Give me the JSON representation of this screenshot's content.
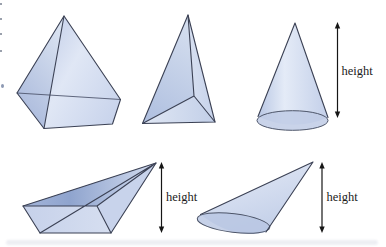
{
  "labels": {
    "cone_height": "height",
    "oblique_pyramid_height": "height",
    "oblique_cone_height": "height"
  },
  "palette": {
    "background": "#ffffff",
    "outline": "#3b4154",
    "soft_outline": "#4a5168",
    "arrow": "#161616",
    "label_text": "#1b1b1b",
    "solid_fill_light": "#dde5f3",
    "solid_fill_mid": "#c3cfe9",
    "solid_fill_dark": "#97aad2",
    "cone_base_fill": "#bfcbe5",
    "oblique_cone_base_fill": "#b8c5e2"
  }
}
